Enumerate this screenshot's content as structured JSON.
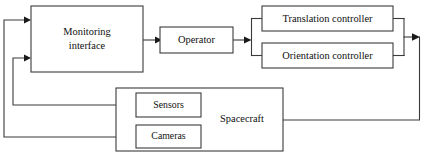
{
  "diagram": {
    "type": "block-diagram",
    "background_color": "#ffffff",
    "line_color": "#3b3b3b",
    "text_color": "#101010",
    "blocks": [
      {
        "id": "monitoring-interface",
        "label_line1": "Monitoring",
        "label_line2": "interface",
        "x": 31,
        "y": 6,
        "w": 112,
        "h": 66
      },
      {
        "id": "operator",
        "label": "Operator",
        "x": 160,
        "y": 27,
        "w": 73,
        "h": 26
      },
      {
        "id": "translation-controller",
        "label": "Translation controller",
        "x": 262,
        "y": 6,
        "w": 131,
        "h": 25
      },
      {
        "id": "orientation-controller",
        "label": "Orientation controller",
        "x": 262,
        "y": 43,
        "w": 131,
        "h": 25
      },
      {
        "id": "spacecraft",
        "label": "Spacecraft",
        "x": 116,
        "y": 88,
        "w": 167,
        "h": 63
      },
      {
        "id": "sensors",
        "label": "Sensors",
        "x": 136,
        "y": 93,
        "w": 65,
        "h": 24
      },
      {
        "id": "cameras",
        "label": "Cameras",
        "x": 136,
        "y": 125,
        "w": 65,
        "h": 23
      }
    ],
    "connections": [
      {
        "id": "monitoring-to-operator",
        "from": "monitoring-interface",
        "to": "operator",
        "arrow": true
      },
      {
        "id": "operator-to-controllers",
        "from": "operator",
        "to": "controller-split",
        "arrow": true
      },
      {
        "id": "split-to-translation",
        "from": "controller-split",
        "to": "translation-controller",
        "arrow": false
      },
      {
        "id": "split-to-orientation",
        "from": "controller-split",
        "to": "orientation-controller",
        "arrow": false
      },
      {
        "id": "translation-to-merge",
        "from": "translation-controller",
        "to": "controller-merge",
        "arrow": false
      },
      {
        "id": "orientation-to-merge",
        "from": "orientation-controller",
        "to": "controller-merge",
        "arrow": false
      },
      {
        "id": "merge-to-output",
        "from": "controller-merge",
        "to": "command-out",
        "arrow": true
      },
      {
        "id": "command-to-spacecraft",
        "from": "command-out",
        "to": "spacecraft",
        "arrow": false
      },
      {
        "id": "sensors-feedback",
        "from": "sensors",
        "to": "monitoring-interface",
        "arrow": true
      },
      {
        "id": "cameras-feedback",
        "from": "cameras",
        "to": "monitoring-interface",
        "arrow": true
      }
    ]
  }
}
